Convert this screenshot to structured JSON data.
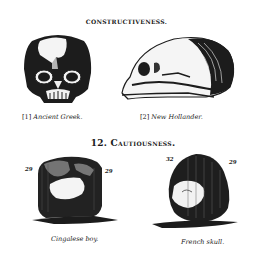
{
  "sections": [
    {
      "heading": "CONSTRUCTIVENESS.",
      "figures": [
        {
          "index": "[1]",
          "caption": "Ancient Greek.",
          "view": "front skull"
        },
        {
          "index": "[2]",
          "caption": "New Hollander.",
          "view": "side skull"
        }
      ]
    },
    {
      "heading": "12. Cautiousness.",
      "figures": [
        {
          "caption": "Cingalese boy.",
          "left_number": "29",
          "right_number": "29",
          "view": "rear skull"
        },
        {
          "caption": "French skull.",
          "left_number": "32",
          "right_number": "29",
          "view": "rear skull"
        }
      ]
    }
  ],
  "colors": {
    "ink": "#1a1a1a",
    "paper": "#ffffff"
  }
}
